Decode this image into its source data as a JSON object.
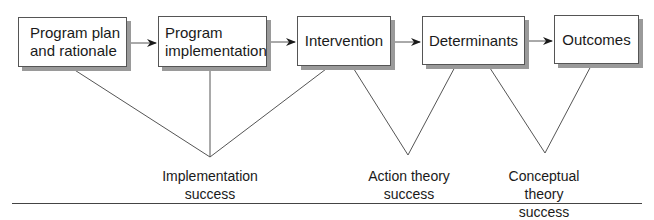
{
  "diagram": {
    "boxes": [
      {
        "id": "program-plan",
        "label": "Program plan\nand rationale"
      },
      {
        "id": "program-implementation",
        "label": "Program\nimplementation"
      },
      {
        "id": "intervention",
        "label": "Intervention"
      },
      {
        "id": "determinants",
        "label": "Determinants"
      },
      {
        "id": "outcomes",
        "label": "Outcomes"
      }
    ],
    "captions": [
      {
        "id": "implementation-success",
        "label": "Implementation\nsuccess"
      },
      {
        "id": "action-theory-success",
        "label": "Action theory\nsuccess"
      },
      {
        "id": "conceptual-theory-success",
        "label": "Conceptual theory\nsuccess"
      }
    ],
    "colors": {
      "line": "#555555",
      "shadow": "#9a9a9a",
      "text": "#1a1a1a"
    }
  }
}
